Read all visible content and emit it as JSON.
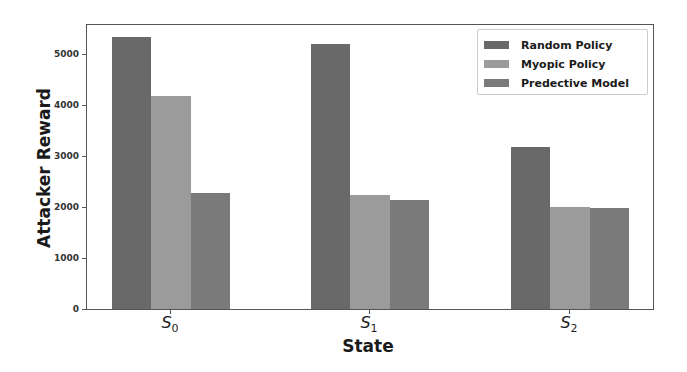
{
  "chart_data": {
    "type": "bar",
    "title": "",
    "xlabel": "State",
    "ylabel": "Attacker Reward",
    "categories": [
      "S0",
      "S1",
      "S2"
    ],
    "category_display": [
      {
        "base": "S",
        "sub": "0"
      },
      {
        "base": "S",
        "sub": "1"
      },
      {
        "base": "S",
        "sub": "2"
      }
    ],
    "series": [
      {
        "name": "Random Policy",
        "color": "#696969",
        "values": [
          5330,
          5200,
          3180
        ]
      },
      {
        "name": "Myopic Policy",
        "color": "#9b9b9b",
        "values": [
          4180,
          2230,
          2000
        ]
      },
      {
        "name": "Predective Model",
        "color": "#7a7a7a",
        "values": [
          2270,
          2140,
          1990
        ]
      }
    ],
    "ylim": [
      0,
      5600
    ],
    "yticks": [
      0,
      1000,
      2000,
      3000,
      4000,
      5000
    ],
    "grid": false,
    "legend_position": "upper right"
  }
}
